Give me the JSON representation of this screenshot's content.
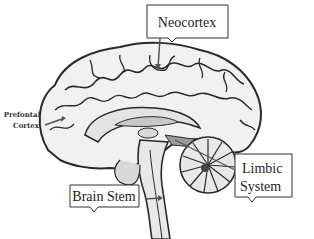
{
  "diagram": {
    "labels": {
      "neocortex": "Neocortex",
      "prefrontal_line1": "Prefontal",
      "prefrontal_line2": "Cortex",
      "limbic_line1": "Limbic",
      "limbic_line2": "System",
      "brain_stem": "Brain Stem"
    },
    "colors": {
      "background": "#ffffff",
      "outline": "#2a2a2a",
      "brain_fill": "#f1f1f1",
      "inner_fill": "#c8c8c8",
      "dark_fill": "#8a8a8a",
      "arrow": "#555555"
    }
  }
}
